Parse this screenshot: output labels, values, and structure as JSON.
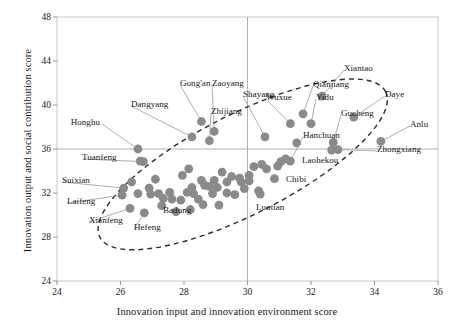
{
  "chart_data": {
    "type": "scatter",
    "title": "",
    "xlabel": "Innovation input and innovation environment score",
    "ylabel": "Innovation output and social contribution score",
    "xlim": [
      24,
      36
    ],
    "ylim": [
      24,
      48
    ],
    "xticks": [
      24,
      26,
      28,
      30,
      32,
      34,
      36
    ],
    "yticks": [
      24,
      28,
      32,
      36,
      40,
      44,
      48
    ],
    "grid": false,
    "legend": "none",
    "reference_lines": [
      {
        "axis": "x",
        "value": 30
      },
      {
        "axis": "y",
        "value": 36
      }
    ],
    "annotation_shape": {
      "type": "dashed-ellipse",
      "center_x": 29.85,
      "center_y": 34.6,
      "radius_x": 5.05,
      "radius_y": 4.55,
      "rotation_deg": -27
    },
    "marker": {
      "shape": "circle",
      "color": "#8a8a8a",
      "size": 4.4
    },
    "points": [
      {
        "label": "Honghu",
        "x": 26.55,
        "y": 36.0,
        "lx": 100,
        "ly": 128,
        "anchor": "end"
      },
      {
        "label": "Tuanfeng",
        "x": 26.72,
        "y": 34.85,
        "lx": 82,
        "ly": 163,
        "anchor": "start"
      },
      {
        "label": "Suixian",
        "x": 26.1,
        "y": 32.45,
        "lx": 62,
        "ly": 186,
        "anchor": "start"
      },
      {
        "label": "Laifeng",
        "x": 26.05,
        "y": 31.8,
        "lx": 67,
        "ly": 207,
        "anchor": "start"
      },
      {
        "label": "Xianfeng",
        "x": 26.3,
        "y": 30.6,
        "lx": 89,
        "ly": 226,
        "anchor": "start"
      },
      {
        "label": "Hefeng",
        "x": 26.75,
        "y": 30.2,
        "lx": 134,
        "ly": 233,
        "anchor": "start"
      },
      {
        "label": "Badong",
        "x": 27.3,
        "y": 30.85,
        "lx": 163,
        "ly": 216,
        "anchor": "start"
      },
      {
        "label": "Dangyang",
        "x": 28.25,
        "y": 37.1,
        "lx": 131,
        "ly": 110,
        "anchor": "start"
      },
      {
        "label": "Gong'an",
        "x": 28.55,
        "y": 38.5,
        "lx": 180,
        "ly": 89,
        "anchor": "start"
      },
      {
        "label": "Zaoyang",
        "x": 28.95,
        "y": 37.6,
        "lx": 212,
        "ly": 89,
        "anchor": "start"
      },
      {
        "label": "Zhijiang",
        "x": 28.8,
        "y": 36.75,
        "lx": 211,
        "ly": 117,
        "anchor": "start"
      },
      {
        "label": "Shayang",
        "x": 30.55,
        "y": 37.1,
        "lx": 243,
        "ly": 100,
        "anchor": "start"
      },
      {
        "label": "Wuxue",
        "x": 31.35,
        "y": 38.3,
        "lx": 266,
        "ly": 103,
        "anchor": "start"
      },
      {
        "label": "Yidu",
        "x": 32.0,
        "y": 38.3,
        "lx": 316,
        "ly": 103,
        "anchor": "start"
      },
      {
        "label": "Qianjiang",
        "x": 31.75,
        "y": 39.2,
        "lx": 313,
        "ly": 90,
        "anchor": "start"
      },
      {
        "label": "Xiantao",
        "x": 32.35,
        "y": 40.8,
        "lx": 344,
        "ly": 74,
        "anchor": "start"
      },
      {
        "label": "Daye",
        "x": 33.35,
        "y": 38.9,
        "lx": 385,
        "ly": 100,
        "anchor": "start"
      },
      {
        "label": "Gucheng",
        "x": 32.7,
        "y": 36.6,
        "lx": 341,
        "ly": 119,
        "anchor": "start"
      },
      {
        "label": "Anlu",
        "x": 34.2,
        "y": 36.7,
        "lx": 410,
        "ly": 130,
        "anchor": "start"
      },
      {
        "label": "Zhongxiang",
        "x": 32.85,
        "y": 35.95,
        "lx": 377,
        "ly": 155,
        "anchor": "start"
      },
      {
        "label": "Hanchuan",
        "x": 31.35,
        "y": 34.9,
        "lx": 303,
        "ly": 141,
        "anchor": "start"
      },
      {
        "label": "Laohekou",
        "x": 31.2,
        "y": 35.1,
        "lx": 302,
        "ly": 166,
        "anchor": "start"
      },
      {
        "label": "Chibi",
        "x": 30.85,
        "y": 33.3,
        "lx": 286,
        "ly": 185,
        "anchor": "start"
      },
      {
        "label": "Luotian",
        "x": 30.4,
        "y": 31.9,
        "lx": 256,
        "ly": 213,
        "anchor": "start"
      }
    ],
    "unlabeled_points": [
      {
        "x": 26.62,
        "y": 34.9
      },
      {
        "x": 26.9,
        "y": 32.45
      },
      {
        "x": 26.55,
        "y": 31.95
      },
      {
        "x": 27.1,
        "y": 33.25
      },
      {
        "x": 26.95,
        "y": 31.9
      },
      {
        "x": 27.2,
        "y": 31.95
      },
      {
        "x": 27.35,
        "y": 31.5
      },
      {
        "x": 27.62,
        "y": 31.45
      },
      {
        "x": 27.55,
        "y": 32.05
      },
      {
        "x": 27.9,
        "y": 31.35
      },
      {
        "x": 27.95,
        "y": 33.6
      },
      {
        "x": 28.25,
        "y": 32.5
      },
      {
        "x": 28.1,
        "y": 32.05
      },
      {
        "x": 28.3,
        "y": 31.95
      },
      {
        "x": 28.45,
        "y": 31.45
      },
      {
        "x": 28.55,
        "y": 33.15
      },
      {
        "x": 28.65,
        "y": 32.7
      },
      {
        "x": 28.8,
        "y": 32.6
      },
      {
        "x": 28.95,
        "y": 33.15
      },
      {
        "x": 29.05,
        "y": 32.5
      },
      {
        "x": 28.9,
        "y": 31.95
      },
      {
        "x": 29.2,
        "y": 33.9
      },
      {
        "x": 29.35,
        "y": 33.0
      },
      {
        "x": 29.5,
        "y": 33.5
      },
      {
        "x": 29.35,
        "y": 32.0
      },
      {
        "x": 29.6,
        "y": 31.85
      },
      {
        "x": 29.75,
        "y": 33.35
      },
      {
        "x": 29.8,
        "y": 33.0
      },
      {
        "x": 30.05,
        "y": 33.6
      },
      {
        "x": 30.05,
        "y": 33.1
      },
      {
        "x": 30.2,
        "y": 34.4
      },
      {
        "x": 30.45,
        "y": 34.6
      },
      {
        "x": 30.6,
        "y": 34.2
      },
      {
        "x": 30.95,
        "y": 34.45
      },
      {
        "x": 31.05,
        "y": 34.85
      },
      {
        "x": 31.55,
        "y": 36.55
      },
      {
        "x": 32.65,
        "y": 35.9
      },
      {
        "x": 27.75,
        "y": 30.3
      },
      {
        "x": 28.2,
        "y": 30.5
      },
      {
        "x": 26.35,
        "y": 33.0
      },
      {
        "x": 29.1,
        "y": 30.9
      },
      {
        "x": 28.15,
        "y": 34.2
      },
      {
        "x": 29.9,
        "y": 32.4
      },
      {
        "x": 30.35,
        "y": 32.2
      },
      {
        "x": 28.6,
        "y": 30.95
      }
    ]
  }
}
